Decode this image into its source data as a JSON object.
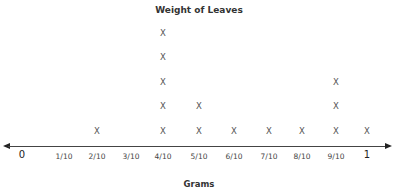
{
  "chart_data": {
    "type": "line_plot",
    "title": "Weight of Leaves",
    "xlabel": "Grams",
    "ylabel": "",
    "marker": "X",
    "categories": [
      "0",
      "1/10",
      "2/10",
      "3/10",
      "4/10",
      "5/10",
      "6/10",
      "7/10",
      "8/10",
      "9/10",
      "1"
    ],
    "values": [
      0,
      0,
      1,
      0,
      5,
      2,
      1,
      1,
      1,
      3,
      1
    ],
    "xlim": [
      0,
      1
    ],
    "grid": false,
    "legend": null
  },
  "layout": {
    "tick_x": [
      22,
      64,
      97,
      131,
      163,
      199,
      234,
      269,
      302,
      336,
      367
    ],
    "row_y": [
      131,
      106,
      82,
      57,
      33
    ]
  }
}
